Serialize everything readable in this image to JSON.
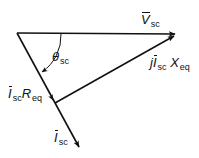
{
  "diagram": {
    "type": "phasor-diagram",
    "colors": {
      "stroke": "#111111",
      "background": "#ffffff"
    },
    "labels": {
      "v_sc": {
        "symbol": "V",
        "subscript": "sc"
      },
      "i_sc": {
        "symbol": "I",
        "subscript": "sc"
      },
      "theta_sc": {
        "symbol": "θ",
        "subscript": "sc"
      },
      "i_r_eq": {
        "symbol": "I",
        "subscript": "sc",
        "factor": "R",
        "factor_subscript": "eq"
      },
      "j_i_x_eq": {
        "prefix": "j",
        "symbol": "I",
        "subscript": "sc",
        "factor": "X",
        "factor_subscript": "eq"
      }
    },
    "vectors": [
      {
        "name": "V_sc",
        "from": [
          17,
          33
        ],
        "to": [
          176,
          34
        ]
      },
      {
        "name": "I_sc",
        "from": [
          17,
          33
        ],
        "to": [
          80,
          148
        ]
      },
      {
        "name": "I_sc R_eq",
        "from": [
          17,
          33
        ],
        "to": [
          54,
          101
        ]
      },
      {
        "name": "j I_sc X_eq",
        "from": [
          55,
          103
        ],
        "to": [
          176,
          35
        ]
      }
    ],
    "angle": {
      "name": "theta_sc",
      "between": [
        "V_sc",
        "I_sc"
      ]
    }
  }
}
